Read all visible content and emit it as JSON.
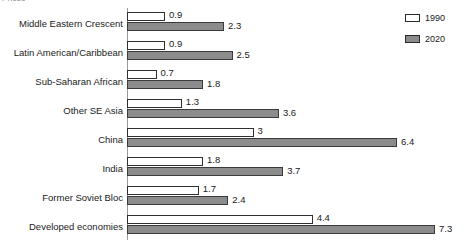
{
  "crop_title": "Prices",
  "legend": {
    "position": "top-right",
    "entries": [
      {
        "label": "1990",
        "color": "#ffffff",
        "swatch": "outlined-white-box"
      },
      {
        "label": "2020",
        "color": "#8c8c8c",
        "swatch": "filled-gray-box"
      }
    ]
  },
  "chart_data": {
    "type": "bar",
    "orientation": "horizontal",
    "title": "",
    "xlabel": "",
    "ylabel": "",
    "grid": false,
    "legend_position": "top-right",
    "xlim": [
      0,
      8
    ],
    "categories": [
      "Middle Eastern Crescent",
      "Latin American/Caribbean",
      "Sub-Saharan African",
      "Other SE Asia",
      "China",
      "India",
      "Former Soviet Bloc",
      "Developed economies"
    ],
    "series": [
      {
        "name": "1990",
        "color": "#ffffff",
        "values": [
          0.9,
          0.9,
          0.7,
          1.3,
          3.0,
          1.8,
          1.7,
          4.4
        ]
      },
      {
        "name": "2020",
        "color": "#8c8c8c",
        "values": [
          2.3,
          2.5,
          1.8,
          3.6,
          6.4,
          3.7,
          2.4,
          7.3
        ]
      }
    ]
  }
}
